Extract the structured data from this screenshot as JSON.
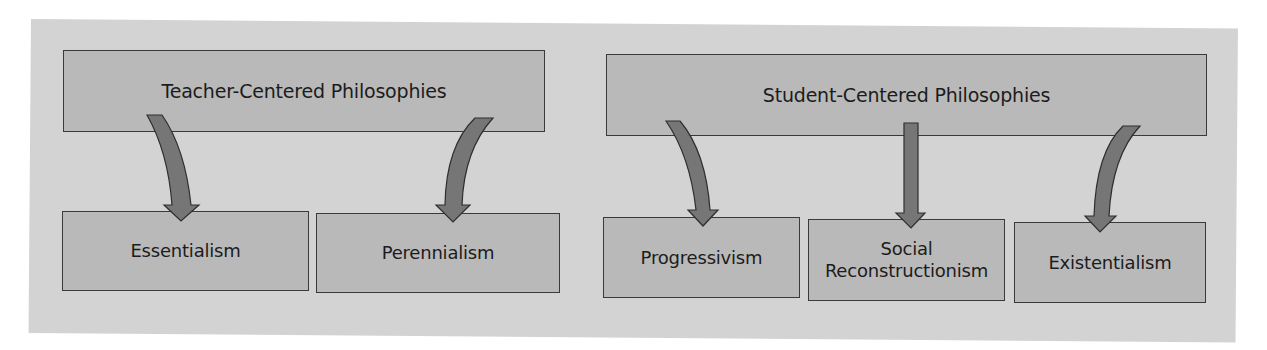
{
  "diagram": {
    "colors": {
      "panel_background": "#d3d3d3",
      "box_fill": "#b9b9b9",
      "box_border": "#3a3a3a",
      "arrow_fill": "#767676",
      "text": "#1c1c1c"
    },
    "groups": [
      {
        "header": "Teacher-Centered Philosophies",
        "children": [
          "Essentialism",
          "Perennialism"
        ]
      },
      {
        "header": "Student-Centered Philosophies",
        "children": [
          "Progressivism",
          "Social Reconstructionism",
          "Existentialism"
        ]
      }
    ],
    "nodes": {
      "teacher_header": "Teacher-Centered Philosophies",
      "student_header": "Student-Centered Philosophies",
      "essentialism": "Essentialism",
      "perennialism": "Perennialism",
      "progressivism": "Progressivism",
      "social_line1": "Social",
      "social_line2": "Reconstructionism",
      "existentialism": "Existentialism"
    },
    "edges": [
      {
        "from": "Teacher-Centered Philosophies",
        "to": "Essentialism",
        "style": "curved"
      },
      {
        "from": "Teacher-Centered Philosophies",
        "to": "Perennialism",
        "style": "curved"
      },
      {
        "from": "Student-Centered Philosophies",
        "to": "Progressivism",
        "style": "curved"
      },
      {
        "from": "Student-Centered Philosophies",
        "to": "Social Reconstructionism",
        "style": "straight"
      },
      {
        "from": "Student-Centered Philosophies",
        "to": "Existentialism",
        "style": "curved"
      }
    ]
  }
}
